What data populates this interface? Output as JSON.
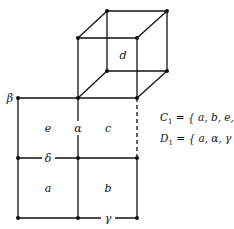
{
  "diagram": {
    "cube_label": "d",
    "region_labels": {
      "upper_left": "e",
      "upper_right": "c",
      "lower_left": "a",
      "lower_right": "b"
    },
    "edge_labels": {
      "left_top_corner": "β",
      "upper_middle_vertical": "α",
      "middle_left_horizontal": "δ",
      "bottom_right_horizontal": "γ"
    },
    "sets": [
      {
        "name": "C",
        "subscript": "1",
        "eq": "=",
        "members": "{ a, b, e, d }"
      },
      {
        "name": "D",
        "subscript": "1",
        "eq": "=",
        "members": "{ a, α, γ }"
      }
    ]
  }
}
